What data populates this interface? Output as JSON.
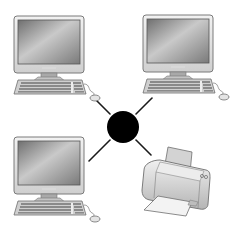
{
  "diagram": {
    "type": "star-network",
    "hub": {
      "label": "",
      "shape": "circle",
      "color": "#000000",
      "cx": 123,
      "cy": 127,
      "r": 16
    },
    "nodes": [
      {
        "id": "computer-top-left",
        "kind": "desktop-computer",
        "x": 14,
        "y": 16
      },
      {
        "id": "computer-top-right",
        "kind": "desktop-computer",
        "x": 143,
        "y": 15
      },
      {
        "id": "computer-bottom-left",
        "kind": "desktop-computer",
        "x": 14,
        "y": 137
      },
      {
        "id": "printer-bottom-right",
        "kind": "printer",
        "x": 140,
        "y": 140
      }
    ],
    "links": [
      {
        "from": "hub",
        "to": "computer-top-left",
        "x1": 110,
        "y1": 114,
        "x2": 97,
        "y2": 101
      },
      {
        "from": "hub",
        "to": "computer-top-right",
        "x1": 136,
        "y1": 114,
        "x2": 152,
        "y2": 98
      },
      {
        "from": "hub",
        "to": "computer-bottom-left",
        "x1": 110,
        "y1": 140,
        "x2": 89,
        "y2": 161
      },
      {
        "from": "hub",
        "to": "printer-bottom-right",
        "x1": 136,
        "y1": 140,
        "x2": 151,
        "y2": 155
      }
    ],
    "colors": {
      "line": "#1a1a1a",
      "device_light": "#e6e6e6",
      "device_mid": "#bdbdbd",
      "device_dark": "#6e6e6e",
      "screen": "#8f8f8f"
    }
  }
}
